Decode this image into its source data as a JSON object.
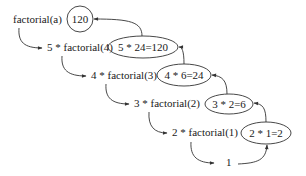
{
  "diagram": {
    "calls": [
      {
        "label": "factorial(a)"
      },
      {
        "label": "5 * factorial(4)"
      },
      {
        "label": "4 * factorial(3)"
      },
      {
        "label": "3 * factorial(2)"
      },
      {
        "label": "2 * factorial(1)"
      },
      {
        "label": "1"
      }
    ],
    "results": [
      {
        "label": "120"
      },
      {
        "label": "5 * 24=120"
      },
      {
        "label": "4 * 6=24"
      },
      {
        "label": "3 * 2=6"
      },
      {
        "label": "2 * 1=2"
      }
    ],
    "colors": {
      "stroke": "#333333",
      "text": "#1a1a1a",
      "background": "#ffffff"
    }
  }
}
